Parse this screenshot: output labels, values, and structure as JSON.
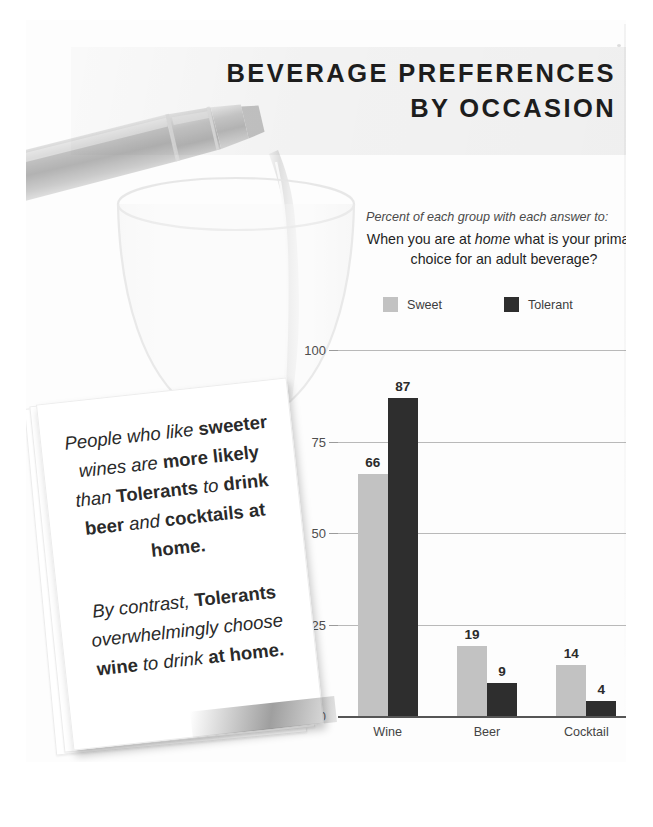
{
  "title": {
    "line1": "BEVERAGE PREFERENCES",
    "line2": "BY OCCASION"
  },
  "subtitle": {
    "lead": "Percent of each group with each answer to:",
    "question_part1": "When you are at ",
    "question_emphasis": "home",
    "question_part2": " what is your primary choice for an adult beverage?"
  },
  "legend": {
    "items": [
      {
        "label": "Sweet",
        "color": "#c2c2c2"
      },
      {
        "label": "Tolerant",
        "color": "#2e2e2e"
      }
    ]
  },
  "callout": {
    "paragraph1": {
      "s1": "People who like ",
      "b1": "sweeter",
      "s2": " wines are ",
      "b2": "more likely",
      "s3": " than ",
      "b3": "Tolerants",
      "s4": " to ",
      "b4": "drink beer",
      "s5": " and ",
      "b5": "cocktails at home."
    },
    "paragraph2": {
      "s1": "By contrast, ",
      "b1": "Tolerants",
      "s2": " overwhelmingly choose ",
      "b2": "wine",
      "s3": " to drink ",
      "b3": "at home."
    }
  },
  "chart_data": {
    "type": "bar",
    "title": "BEVERAGE PREFERENCES BY OCCASION",
    "subtitle": "Percent of each group with each answer to: When you are at home what is your primary choice for an adult beverage?",
    "categories": [
      "Wine",
      "Beer",
      "Cocktail"
    ],
    "series": [
      {
        "name": "Sweet",
        "color": "#c2c2c2",
        "values": [
          66,
          19,
          14
        ]
      },
      {
        "name": "Tolerant",
        "color": "#2e2e2e",
        "values": [
          87,
          9,
          4
        ]
      }
    ],
    "xlabel": "",
    "ylabel": "",
    "ylim": [
      0,
      100
    ],
    "yticks": [
      0,
      25,
      50,
      75,
      100
    ],
    "ytick_labels": [
      "0",
      "25",
      "50",
      "75",
      "100"
    ],
    "grid": true,
    "data_labels": true,
    "legend_position": "top-left"
  }
}
